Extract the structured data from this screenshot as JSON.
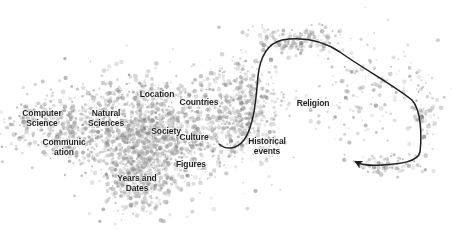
{
  "chart_data": {
    "type": "scatter",
    "title": "",
    "xlabel": "",
    "ylabel": "",
    "grid": false,
    "legend": null,
    "point_color": "#8a8a8a",
    "clusters": [
      {
        "label": "Computer\nScience",
        "x": 42,
        "y": 118
      },
      {
        "label": "Natural\nSciences",
        "x": 106,
        "y": 118
      },
      {
        "label": "Communic\nation",
        "x": 64,
        "y": 147
      },
      {
        "label": "Location",
        "x": 157,
        "y": 94
      },
      {
        "label": "Countries",
        "x": 199,
        "y": 102
      },
      {
        "label": "Society",
        "x": 166,
        "y": 131
      },
      {
        "label": "Culture",
        "x": 194,
        "y": 137
      },
      {
        "label": "Historical\nevents",
        "x": 267,
        "y": 146
      },
      {
        "label": "Religion",
        "x": 313,
        "y": 103
      },
      {
        "label": "Figures",
        "x": 191,
        "y": 164
      },
      {
        "label": "Years and\nDates",
        "x": 137,
        "y": 183
      }
    ],
    "density_regions": [
      {
        "name": "main-cluster",
        "cx": 150,
        "cy": 135,
        "rx": 75,
        "ry": 55,
        "n": 1400
      },
      {
        "name": "left-wing",
        "cx": 60,
        "cy": 125,
        "rx": 55,
        "ry": 32,
        "n": 380
      },
      {
        "name": "lower-tail",
        "cx": 140,
        "cy": 180,
        "rx": 30,
        "ry": 32,
        "n": 320
      },
      {
        "name": "diagonal-arm",
        "cx": 240,
        "cy": 110,
        "rx": 40,
        "ry": 55,
        "n": 500
      },
      {
        "name": "upper-arm",
        "cx": 300,
        "cy": 40,
        "rx": 45,
        "ry": 14,
        "n": 160
      },
      {
        "name": "right-sparse",
        "cx": 370,
        "cy": 95,
        "rx": 75,
        "ry": 60,
        "n": 160
      },
      {
        "name": "far-right",
        "cx": 425,
        "cy": 110,
        "rx": 14,
        "ry": 35,
        "n": 60
      },
      {
        "name": "bottom-right",
        "cx": 390,
        "cy": 165,
        "rx": 40,
        "ry": 10,
        "n": 70
      }
    ],
    "trajectory": {
      "color": "#1e1e1e",
      "path": "M219,144 C226,150 236,150 244,140 C254,126 256,100 258,76 C260,58 266,44 282,40 C300,37 320,39 340,52 C362,68 392,84 412,100 C421,110 422,135 420,152 C418,162 400,164 382,165 C370,166 362,165 356,162",
      "arrowhead_at": [
        355,
        162
      ],
      "direction": "Historical events → Religion → right loop"
    }
  }
}
